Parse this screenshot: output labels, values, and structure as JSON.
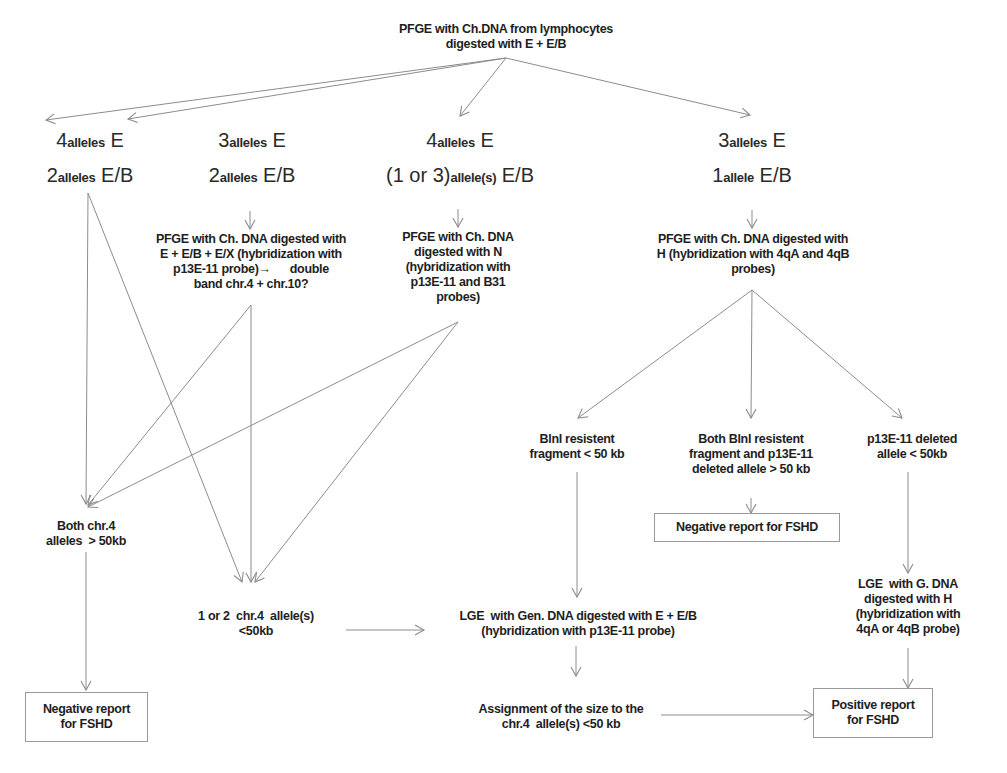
{
  "diagram": {
    "type": "flowchart",
    "root": {
      "id": "root",
      "lines": [
        "PFGE with Ch.DNA from lymphocytes",
        "digested with E + E/B"
      ]
    },
    "branches": [
      {
        "id": "b1",
        "line1": {
          "num": "4",
          "sub": "alleles",
          "tail": " E"
        },
        "line2": {
          "num": "2",
          "sub": "alleles",
          "tail": " E/B"
        }
      },
      {
        "id": "b2",
        "line1": {
          "num": "3",
          "sub": "alleles",
          "tail": " E"
        },
        "line2": {
          "num": "2",
          "sub": "alleles",
          "tail": " E/B"
        }
      },
      {
        "id": "b3",
        "line1": {
          "num": "4",
          "sub": "alleles",
          "tail": " E"
        },
        "line2": {
          "num": "(1 or 3)",
          "sub": "allele(s)",
          "tail": " E/B"
        }
      },
      {
        "id": "b4",
        "line1": {
          "num": "3",
          "sub": "alleles",
          "tail": " E"
        },
        "line2": {
          "num": "1",
          "sub": "allele",
          "tail": " E/B"
        }
      }
    ],
    "steps": {
      "pfge_exx": [
        "PFGE with Ch. DNA digested with",
        "E + E/B + E/X  (hybridization with",
        "p13E-11 probe)→      double",
        "band chr.4 + chr.10?"
      ],
      "pfge_n": [
        "PFGE with Ch. DNA",
        "digested with N",
        "(hybridization with",
        "p13E-11 and B31",
        "probes)"
      ],
      "pfge_h": [
        "PFGE with Ch. DNA digested with",
        "H (hybridization with 4qA and 4qB",
        "probes)"
      ],
      "blni_lt50": [
        "BlnI resistent",
        "fragment < 50 kb"
      ],
      "both_gt50": [
        "Both BlnI resistent",
        "fragment and p13E-11",
        "deleted allele > 50 kb"
      ],
      "p13_deleted": [
        "p13E-11 deleted",
        "allele < 50kb"
      ],
      "both_chr4": [
        "Both chr.4",
        "alleles  > 50kb"
      ],
      "one_or_two": [
        "1 or 2  chr.4  allele(s)",
        "<50kb"
      ],
      "lge_gen": [
        "LGE  with Gen. DNA digested with E + E/B",
        "(hybridization with p13E-11 probe)"
      ],
      "lge_g_h": [
        "LGE  with G. DNA",
        "digested with H",
        "(hybridization with",
        "4qA or 4qB probe)"
      ],
      "assignment": [
        "Assignment of the size to the",
        "chr.4  allele(s) <50 kb"
      ]
    },
    "outcomes": {
      "negative_left": [
        "Negative report",
        "for FSHD"
      ],
      "negative_right": [
        "Negative report for FSHD"
      ],
      "positive": [
        "Positive report",
        "for FSHD"
      ]
    },
    "colors": {
      "edge": "#8c8c8c",
      "text": "#1e1e1e",
      "box_border": "#9a9a9a"
    }
  }
}
